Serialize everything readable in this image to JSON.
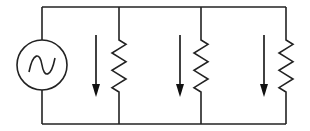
{
  "diagram": {
    "title": "",
    "type": "parallel AC circuit",
    "source": {
      "kind": "ac-voltage-source",
      "symbol": "sine"
    },
    "branches": [
      {
        "id": "R1",
        "kind": "resistor",
        "current_direction": "down"
      },
      {
        "id": "R2",
        "kind": "resistor",
        "current_direction": "down"
      },
      {
        "id": "R3",
        "kind": "resistor",
        "current_direction": "down"
      }
    ],
    "colors": {
      "line": "#222222",
      "background": "#ffffff"
    }
  }
}
